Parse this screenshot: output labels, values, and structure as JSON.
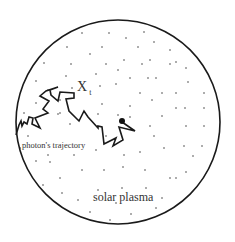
{
  "diagram": {
    "labels": {
      "position": "X",
      "position_subscript": "t",
      "trajectory": "photon's trajectory",
      "medium": "solar plasma"
    },
    "colors": {
      "stroke": "#1a1a1a",
      "text": "#333333",
      "particles": "#444444",
      "background": "#ffffff"
    },
    "boundary": {
      "cx": 118,
      "cy": 122,
      "r": 102
    },
    "photon_start": {
      "x": 122,
      "y": 122,
      "r": 3
    },
    "trajectory_points": "16,135 19,125 22,124 23,119 27,120 27,124 31,127 33,133 36,131 32,123 37,118 42,122 39,127 45,129 43,119 40,114 47,108 51,116 41,108 50,105 57,101 49,94 56,91 58,101 53,104 49,107 44,106 40,109 50,116 55,110 56,118 52,111 46,107 40,110 48,115",
    "particle_count": 90
  }
}
